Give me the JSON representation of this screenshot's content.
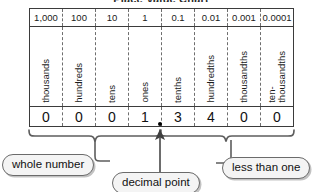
{
  "title": "Place Value Chart",
  "table": {
    "value_header_label": "place values",
    "name_header_label": "place names",
    "digit_header_label": "digits",
    "columns": [
      {
        "value": "1,000",
        "name": "thousands",
        "digit": "0"
      },
      {
        "value": "100",
        "name": "hundreds",
        "digit": "0"
      },
      {
        "value": "10",
        "name": "tens",
        "digit": "0"
      },
      {
        "value": "1",
        "name": "ones",
        "digit": "1"
      },
      {
        "value": "0.1",
        "name": "tenths",
        "digit": "3"
      },
      {
        "value": "0.01",
        "name": "hundredths",
        "digit": "4"
      },
      {
        "value": "0.001",
        "name": "thousandths",
        "digit": "0"
      },
      {
        "value": "0.0001",
        "name": "ten-\nthousandths",
        "digit": "0"
      }
    ]
  },
  "callouts": {
    "whole_number": "whole number",
    "decimal_point": "decimal point",
    "less_than_one": "less than one"
  },
  "colors": {
    "ink": "#1b1b1b",
    "rule": "#3b3b3b",
    "dashed_rule": "#6e6e6e",
    "pill_fill": "#f4f4f4",
    "pill_stroke": "#6b6b6b",
    "connector": "#5d5d5d",
    "background": "#ffffff"
  }
}
